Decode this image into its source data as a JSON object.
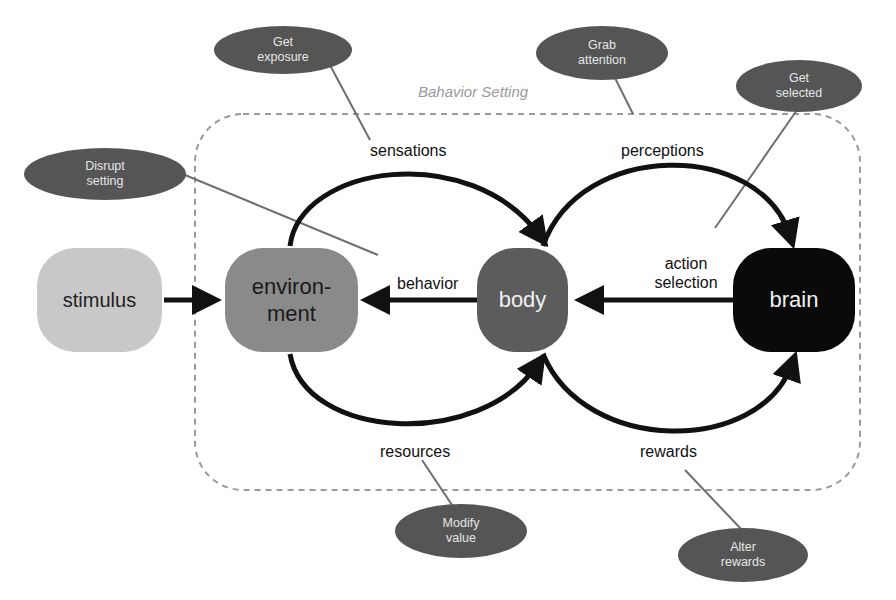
{
  "setting": {
    "title": "Bahavior Setting"
  },
  "nodes": {
    "stimulus": {
      "label": "stimulus",
      "color": "#c8c8c8",
      "text_color": "#222222"
    },
    "environment": {
      "label": "environ-\nment",
      "line1": "environ-",
      "line2": "ment",
      "color": "#8a8a8a",
      "text_color": "#1a1a1a"
    },
    "body": {
      "label": "body",
      "color": "#5c5c5c",
      "text_color": "#f0f0f0"
    },
    "brain": {
      "label": "brain",
      "color": "#0a0a0a",
      "text_color": "#f2f2f2"
    }
  },
  "edges": {
    "sensations": "sensations",
    "perceptions": "perceptions",
    "behavior": "behavior",
    "action_selection_1": "action",
    "action_selection_2": "selection",
    "resources": "resources",
    "rewards": "rewards"
  },
  "interventions": {
    "get_exposure": {
      "line1": "Get",
      "line2": "exposure"
    },
    "grab_attention": {
      "line1": "Grab",
      "line2": "attention"
    },
    "get_selected": {
      "line1": "Get",
      "line2": "selected"
    },
    "disrupt_setting": {
      "line1": "Disrupt",
      "line2": "setting"
    },
    "modify_value": {
      "line1": "Modify",
      "line2": "value"
    },
    "alter_rewards": {
      "line1": "Alter",
      "line2": "rewards"
    }
  },
  "colors": {
    "bubble": "#555555",
    "bubble_text": "#e6e6e6",
    "arrow": "#111111",
    "dashed_border": "#9a9a9a",
    "leader_line": "#6e6e6e"
  }
}
